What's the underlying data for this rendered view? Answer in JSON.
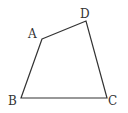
{
  "figure": {
    "type": "quadrilateral",
    "stroke_color": "#333333",
    "vertices": [
      {
        "name": "A",
        "label": "A",
        "x": 42,
        "y": 39
      },
      {
        "name": "D",
        "label": "D",
        "x": 86,
        "y": 21
      },
      {
        "name": "C",
        "label": "C",
        "x": 107,
        "y": 98
      },
      {
        "name": "B",
        "label": "B",
        "x": 21,
        "y": 98
      }
    ]
  }
}
